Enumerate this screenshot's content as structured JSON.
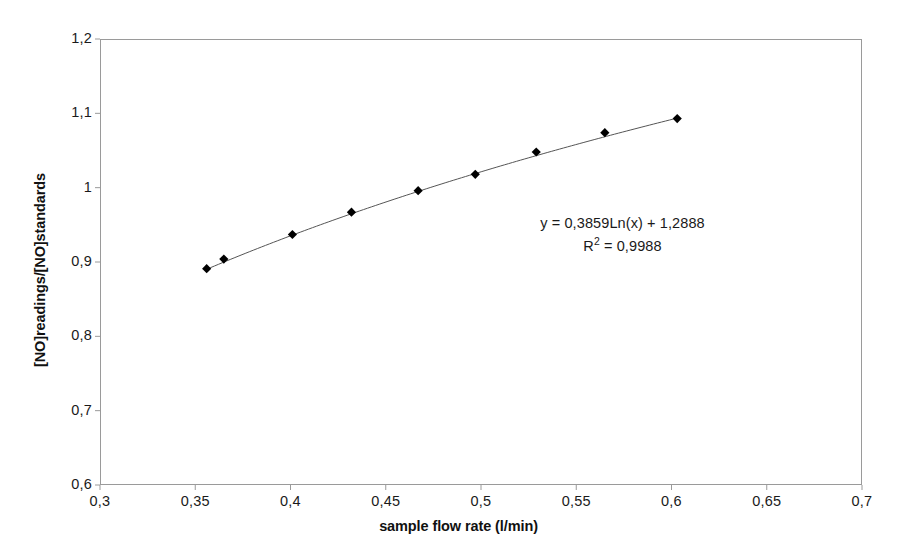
{
  "chart_data": {
    "type": "scatter",
    "title": "",
    "xlabel": "sample flow rate (l/min)",
    "ylabel": "[NO]readings/[NO]standards",
    "xlim": [
      0.3,
      0.7
    ],
    "ylim": [
      0.6,
      1.2
    ],
    "grid": false,
    "legend": "none",
    "marker": "diamond",
    "marker_color": "#000000",
    "line_color": "#555555",
    "x_ticks": [
      "0,3",
      "0,35",
      "0,4",
      "0,45",
      "0,5",
      "0,55",
      "0,6",
      "0,65",
      "0,7"
    ],
    "x_tick_values": [
      0.3,
      0.35,
      0.4,
      0.45,
      0.5,
      0.55,
      0.6,
      0.65,
      0.7
    ],
    "y_ticks": [
      "0,6",
      "0,7",
      "0,8",
      "0,9",
      "1",
      "1,1",
      "1,2"
    ],
    "y_tick_values": [
      0.6,
      0.7,
      0.8,
      0.9,
      1.0,
      1.1,
      1.2
    ],
    "x": [
      0.356,
      0.365,
      0.401,
      0.432,
      0.467,
      0.497,
      0.529,
      0.565,
      0.603
    ],
    "y": [
      0.891,
      0.904,
      0.937,
      0.967,
      0.996,
      1.018,
      1.048,
      1.074,
      1.093
    ],
    "points": [
      {
        "x": 0.356,
        "y": 0.891
      },
      {
        "x": 0.365,
        "y": 0.904
      },
      {
        "x": 0.401,
        "y": 0.937
      },
      {
        "x": 0.432,
        "y": 0.967
      },
      {
        "x": 0.467,
        "y": 0.996
      },
      {
        "x": 0.497,
        "y": 1.018
      },
      {
        "x": 0.529,
        "y": 1.048
      },
      {
        "x": 0.565,
        "y": 1.074
      },
      {
        "x": 0.603,
        "y": 1.093
      }
    ],
    "trendline": {
      "type": "logarithmic",
      "coefficient": 0.3859,
      "intercept": 1.2888,
      "r_squared": 0.9988
    },
    "annotations": {
      "equation": "y = 0,3859Ln(x) + 1,2888",
      "r_squared_prefix": "R",
      "r_squared_exponent": "2",
      "r_squared_value": " = 0,9988"
    }
  },
  "axes": {
    "x_title": "sample flow rate (l/min)",
    "y_title": "[NO]readings/[NO]standards"
  }
}
